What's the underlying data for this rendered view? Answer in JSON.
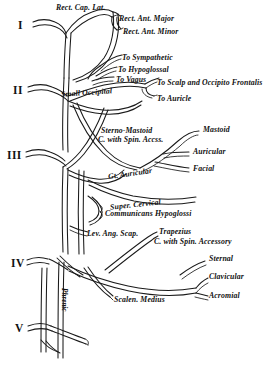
{
  "figure": {
    "background_color": "#ffffff",
    "line_color": "#1a1a1a",
    "text_color": "#111111"
  },
  "roots": [
    {
      "id": "root-1",
      "numeral": "I",
      "x": 18,
      "y": 19
    },
    {
      "id": "root-2",
      "numeral": "II",
      "x": 13,
      "y": 84
    },
    {
      "id": "root-3",
      "numeral": "III",
      "x": 7,
      "y": 149
    },
    {
      "id": "root-4",
      "numeral": "IV",
      "x": 11,
      "y": 257
    },
    {
      "id": "root-5",
      "numeral": "V",
      "x": 15,
      "y": 322
    }
  ],
  "labels": [
    {
      "id": "rect-cap-lat",
      "text": "Rect. Cap. Lat.",
      "x": 56,
      "y": 4,
      "size": "md"
    },
    {
      "id": "rect-ant-major",
      "text": "Rect. Ant. Major",
      "x": 119,
      "y": 15,
      "size": "md"
    },
    {
      "id": "rect-ant-minor",
      "text": "Rect. Ant. Minor",
      "x": 123,
      "y": 28,
      "size": "md"
    },
    {
      "id": "to-sympathetic",
      "text": "To Sympathetic",
      "x": 122,
      "y": 54,
      "size": "md"
    },
    {
      "id": "to-hypoglossal",
      "text": "To Hypoglossal",
      "x": 118,
      "y": 66,
      "size": "md"
    },
    {
      "id": "to-vagus",
      "text": "To Vagus",
      "x": 116,
      "y": 76,
      "size": "md"
    },
    {
      "id": "to-scalp-occipito",
      "text": "To Scalp and Occipito Frontalis",
      "x": 157,
      "y": 79,
      "size": "md"
    },
    {
      "id": "small-occipital",
      "text": "Small Occipital",
      "x": 61,
      "y": 89,
      "size": "md"
    },
    {
      "id": "to-auricle",
      "text": "To Auricle",
      "x": 157,
      "y": 95,
      "size": "md"
    },
    {
      "id": "sterno-mastoid",
      "text": "Sterno-Mastoid",
      "x": 101,
      "y": 127,
      "size": "md"
    },
    {
      "id": "c-with-spin-accss",
      "text": "C. with Spin. Accss.",
      "x": 98,
      "y": 136,
      "size": "md"
    },
    {
      "id": "mastoid",
      "text": "Mastoid",
      "x": 203,
      "y": 131,
      "size": "md"
    },
    {
      "id": "auricular",
      "text": "Auricular",
      "x": 203,
      "y": 151,
      "size": "md"
    },
    {
      "id": "facial",
      "text": "Facial",
      "x": 203,
      "y": 168,
      "size": "md"
    },
    {
      "id": "gt-auricular",
      "text": "Gt. Auricular",
      "x": 108,
      "y": 170,
      "size": "md"
    },
    {
      "id": "super-cervical",
      "text": "Super. Cervical",
      "x": 110,
      "y": 201,
      "size": "md"
    },
    {
      "id": "communicans-hypo",
      "text": "Communicans Hypoglossi",
      "x": 103,
      "y": 212,
      "size": "md"
    },
    {
      "id": "lev-ang-scap",
      "text": "Lev. Ang. Scap.",
      "x": 85,
      "y": 232,
      "size": "md"
    },
    {
      "id": "trapezius",
      "text": "Trapezius",
      "x": 157,
      "y": 231,
      "size": "md"
    },
    {
      "id": "c-with-spin-access",
      "text": "C. with Spin. Accessory",
      "x": 152,
      "y": 240,
      "size": "md"
    },
    {
      "id": "sternal",
      "text": "Sternal",
      "x": 212,
      "y": 258,
      "size": "md"
    },
    {
      "id": "clavicular",
      "text": "Clavicular",
      "x": 212,
      "y": 276,
      "size": "md"
    },
    {
      "id": "acromial",
      "text": "Acromial",
      "x": 212,
      "y": 294,
      "size": "md"
    },
    {
      "id": "scalen-medius",
      "text": "Scalen. Medius",
      "x": 113,
      "y": 299,
      "size": "md"
    }
  ],
  "vertical_labels": [
    {
      "id": "phrenic",
      "text": "Phrenic",
      "x": 63,
      "y": 288
    }
  ]
}
